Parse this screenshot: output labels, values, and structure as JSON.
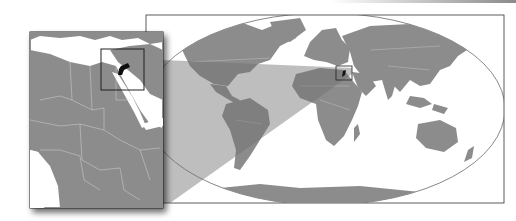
{
  "map": {
    "title": "Location of Jordan",
    "highlighted_country": "Jordan",
    "inset_region": "Northeast Africa and Middle East",
    "main_view": "World map",
    "colors": {
      "land": "#8c8c8c",
      "water": "#ffffff",
      "highlight": "#111111",
      "borders": "#d8d8d8",
      "frame": "#222222",
      "projection_beam": "#6e6e6e"
    }
  }
}
